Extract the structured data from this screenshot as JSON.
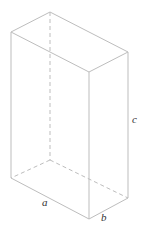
{
  "diagram": {
    "type": "rectangular-prism",
    "line_color": "#b8b8b8",
    "labels": {
      "a": "a",
      "b": "b",
      "c": "c"
    }
  }
}
